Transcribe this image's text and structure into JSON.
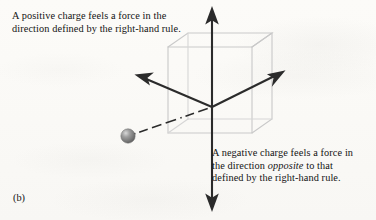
{
  "figure": {
    "panel_label": "(b)",
    "captions": {
      "positive_charge": {
        "lines": [
          "A positive charge feels a force in the",
          "direction defined by the right-hand rule."
        ]
      },
      "negative_charge": {
        "line1": "A negative charge feels a force in",
        "line2_before": "the direction ",
        "line2_emphasis": "opposite",
        "line2_after": " to that",
        "line3": "defined by the right-hand rule."
      }
    },
    "diagram": {
      "type": "3d-axes-with-charge",
      "origin": {
        "x": 212,
        "y": 107
      },
      "axes": [
        {
          "name": "vertical-axis-up",
          "tip_x": 212,
          "tip_y": 10,
          "arrowhead": true
        },
        {
          "name": "vertical-axis-down",
          "tip_x": 212,
          "tip_y": 208,
          "arrowhead": true
        },
        {
          "name": "diagonal-axis-upper-left",
          "tip_x": 138,
          "tip_y": 75,
          "arrowhead": true
        },
        {
          "name": "diagonal-axis-upper-right",
          "tip_x": 282,
          "tip_y": 72,
          "arrowhead": true
        }
      ],
      "dashed_line": {
        "name": "charge-trajectory",
        "from_x": 133,
        "from_y": 134,
        "to_x": 212,
        "to_y": 107
      },
      "charge_sphere": {
        "cx": 128,
        "cy": 136,
        "r": 7.2
      },
      "cube": {
        "name": "field-region-cube",
        "front_left_x": 168,
        "front_right_x": 252,
        "top_y": 47,
        "bottom_y": 133,
        "depth_dx": 20,
        "depth_dy": -14
      }
    },
    "colors": {
      "ink": "#131313",
      "axis": "#2b2b2b",
      "cube_line": "#c9c9c9",
      "sphere_mid": "#8c8c8c",
      "sphere_dark": "#6a6a6a",
      "sphere_highlight": "#d8d8d8",
      "paper": "#fbfaf7"
    }
  }
}
